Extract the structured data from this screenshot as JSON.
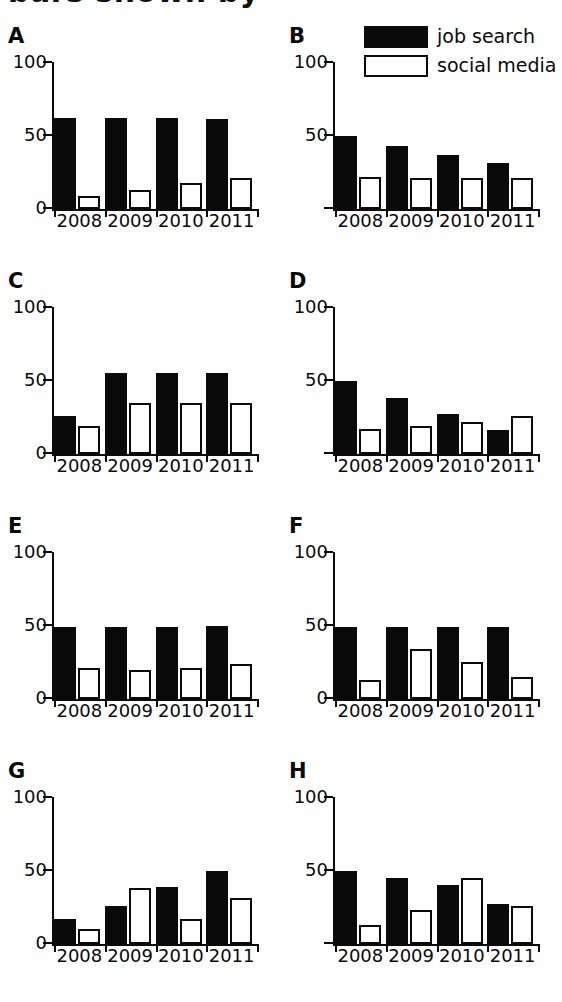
{
  "figure": {
    "title_fragment": "bars shown by",
    "categories": [
      "2008",
      "2009",
      "2010",
      "2011"
    ],
    "y_ticks": [
      "100",
      "50",
      "0"
    ],
    "ylim": [
      0,
      100
    ],
    "colors": {
      "job_search": "#0a0a0a",
      "social_media": "#ffffff",
      "ink": "#0a0a0a"
    }
  },
  "legend": {
    "position": "top-right",
    "items": [
      {
        "label": "job search",
        "style": "filled",
        "swatch": "black-filled-rect"
      },
      {
        "label": "social media",
        "style": "hollow",
        "swatch": "white-outlined-rect"
      }
    ]
  },
  "chart_data": [
    {
      "panel": "A",
      "type": "bar",
      "title": "A",
      "xlabel": "",
      "ylabel": "",
      "ylim": [
        0,
        100
      ],
      "y_ticks": [
        "100",
        "50",
        "0"
      ],
      "show_zero_label": true,
      "grid": false,
      "categories": [
        "2008",
        "2009",
        "2010",
        "2011"
      ],
      "series": [
        {
          "name": "job search",
          "values": [
            62,
            62,
            62,
            61
          ]
        },
        {
          "name": "social media",
          "values": [
            9,
            13,
            18,
            21
          ]
        }
      ]
    },
    {
      "panel": "B",
      "type": "bar",
      "title": "B",
      "xlabel": "",
      "ylabel": "",
      "ylim": [
        0,
        100
      ],
      "y_ticks": [
        "100",
        "50"
      ],
      "show_zero_label": false,
      "grid": false,
      "categories": [
        "2008",
        "2009",
        "2010",
        "2011"
      ],
      "series": [
        {
          "name": "job search",
          "values": [
            50,
            43,
            37,
            31
          ]
        },
        {
          "name": "social media",
          "values": [
            22,
            21,
            21,
            21
          ]
        }
      ]
    },
    {
      "panel": "C",
      "type": "bar",
      "title": "C",
      "xlabel": "",
      "ylabel": "",
      "ylim": [
        0,
        100
      ],
      "y_ticks": [
        "100",
        "50",
        "0"
      ],
      "show_zero_label": true,
      "grid": false,
      "categories": [
        "2008",
        "2009",
        "2010",
        "2011"
      ],
      "series": [
        {
          "name": "job search",
          "values": [
            26,
            55,
            55,
            55
          ]
        },
        {
          "name": "social media",
          "values": [
            19,
            35,
            35,
            35
          ]
        }
      ]
    },
    {
      "panel": "D",
      "type": "bar",
      "title": "D",
      "xlabel": "",
      "ylabel": "",
      "ylim": [
        0,
        100
      ],
      "y_ticks": [
        "100",
        "50"
      ],
      "show_zero_label": false,
      "grid": false,
      "categories": [
        "2008",
        "2009",
        "2010",
        "2011"
      ],
      "series": [
        {
          "name": "job search",
          "values": [
            50,
            38,
            27,
            16
          ]
        },
        {
          "name": "social media",
          "values": [
            17,
            19,
            22,
            26
          ]
        }
      ]
    },
    {
      "panel": "E",
      "type": "bar",
      "title": "E",
      "xlabel": "",
      "ylabel": "",
      "ylim": [
        0,
        100
      ],
      "y_ticks": [
        "100",
        "50",
        "0"
      ],
      "show_zero_label": true,
      "grid": false,
      "categories": [
        "2008",
        "2009",
        "2010",
        "2011"
      ],
      "series": [
        {
          "name": "job search",
          "values": [
            49,
            49,
            49,
            50
          ]
        },
        {
          "name": "social media",
          "values": [
            21,
            20,
            21,
            24
          ]
        }
      ]
    },
    {
      "panel": "F",
      "type": "bar",
      "title": "F",
      "xlabel": "",
      "ylabel": "",
      "ylim": [
        0,
        100
      ],
      "y_ticks": [
        "100",
        "50",
        "0"
      ],
      "show_zero_label": true,
      "grid": false,
      "categories": [
        "2008",
        "2009",
        "2010",
        "2011"
      ],
      "series": [
        {
          "name": "job search",
          "values": [
            49,
            49,
            49,
            49
          ]
        },
        {
          "name": "social media",
          "values": [
            13,
            34,
            25,
            15
          ]
        }
      ]
    },
    {
      "panel": "G",
      "type": "bar",
      "title": "G",
      "xlabel": "",
      "ylabel": "",
      "ylim": [
        0,
        100
      ],
      "y_ticks": [
        "100",
        "50",
        "0"
      ],
      "show_zero_label": true,
      "grid": false,
      "categories": [
        "2008",
        "2009",
        "2010",
        "2011"
      ],
      "series": [
        {
          "name": "job search",
          "values": [
            17,
            26,
            39,
            50
          ]
        },
        {
          "name": "social media",
          "values": [
            10,
            38,
            17,
            31
          ]
        }
      ]
    },
    {
      "panel": "H",
      "type": "bar",
      "title": "H",
      "xlabel": "",
      "ylabel": "",
      "ylim": [
        0,
        100
      ],
      "y_ticks": [
        "100",
        "50"
      ],
      "show_zero_label": false,
      "grid": false,
      "categories": [
        "2008",
        "2009",
        "2010",
        "2011"
      ],
      "series": [
        {
          "name": "job search",
          "values": [
            50,
            45,
            40,
            27
          ]
        },
        {
          "name": "social media",
          "values": [
            13,
            23,
            45,
            26
          ]
        }
      ]
    }
  ]
}
